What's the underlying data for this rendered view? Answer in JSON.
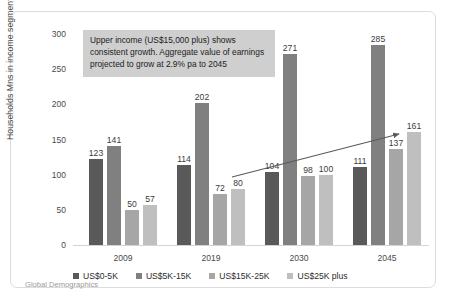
{
  "annotation": {
    "text": "Upper income (US$15,000 plus) shows consistent growth.  Aggregate value of earnings projected to grow at 2.9% pa to 2045",
    "background": "#cfcfcf"
  },
  "source_caption": "Global Demographics",
  "chart_data": {
    "type": "bar",
    "title": "",
    "xlabel": "",
    "ylabel": "Households Mns in income segment",
    "categories": [
      "2009",
      "2019",
      "2030",
      "2045"
    ],
    "ylim": [
      0,
      300
    ],
    "yticks": [
      "0",
      "50",
      "100",
      "150",
      "200",
      "250",
      "300"
    ],
    "grid": false,
    "legend_position": "bottom",
    "series": [
      {
        "name": "US$0-5K",
        "color": "#595959",
        "values": [
          123,
          114,
          104,
          111
        ]
      },
      {
        "name": "US$5K-15K",
        "color": "#808080",
        "values": [
          141,
          202,
          271,
          285
        ]
      },
      {
        "name": "US$15K-25K",
        "color": "#a6a6a6",
        "values": [
          50,
          72,
          98,
          137
        ]
      },
      {
        "name": "US$25K plus",
        "color": "#bfbfbf",
        "values": [
          57,
          80,
          100,
          161
        ]
      }
    ],
    "annotations": [
      {
        "name": "growth-trend-arrow",
        "type": "arrow",
        "from": [
          221,
          165
        ],
        "to": [
          388,
          122
        ],
        "color": "#5a5a5a"
      }
    ]
  }
}
